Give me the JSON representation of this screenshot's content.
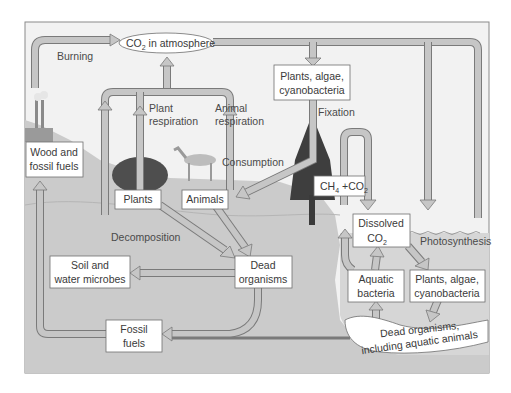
{
  "colors": {
    "sky": "#f1f1f1",
    "land": "#c9c9c9",
    "underground": "#cfcfcf",
    "water": "#dcdcdc",
    "arrow_fill": "#c6c6c6",
    "arrow_stroke": "#7a7a7a",
    "box_fill": "#ffffff",
    "box_stroke": "#6f6f6f",
    "frame": "#8a8a8a",
    "text": "#3a3a3a"
  },
  "nodes": {
    "atmosphere": {
      "line1": "CO",
      "sub": "2",
      "line2": " in atmosphere"
    },
    "plants_top": {
      "line1": "Plants, algae,",
      "line2": "cyanobacteria"
    },
    "wood": {
      "line1": "Wood and",
      "line2": "fossil fuels"
    },
    "plants": {
      "label": "Plants"
    },
    "animals": {
      "label": "Animals"
    },
    "ch4": {
      "a": "CH",
      "a_sub": "4",
      "b": " +CO",
      "b_sub": "2"
    },
    "dissolved": {
      "line1": "Dissolved",
      "line2": "CO",
      "line2_sub": "2"
    },
    "soil": {
      "line1": "Soil and",
      "line2": "water microbes"
    },
    "dead": {
      "line1": "Dead",
      "line2": "organisms"
    },
    "aquatic_bacteria": {
      "line1": "Aquatic",
      "line2": "bacteria"
    },
    "plants_aquatic": {
      "line1": "Plants, algae,",
      "line2": "cyanobacteria"
    },
    "fossil": {
      "line1": "Fossil",
      "line2": "fuels"
    },
    "dead_aquatic": {
      "line1": "Dead organisms,",
      "line2": "including aquatic animals"
    }
  },
  "flows": {
    "burning": "Burning",
    "plant_resp_1": "Plant",
    "plant_resp_2": "respiration",
    "animal_resp_1": "Animal",
    "animal_resp_2": "respiration",
    "fixation": "Fixation",
    "consumption": "Consumption",
    "decomposition": "Decomposition",
    "photosynthesis": "Photosynthesis"
  }
}
